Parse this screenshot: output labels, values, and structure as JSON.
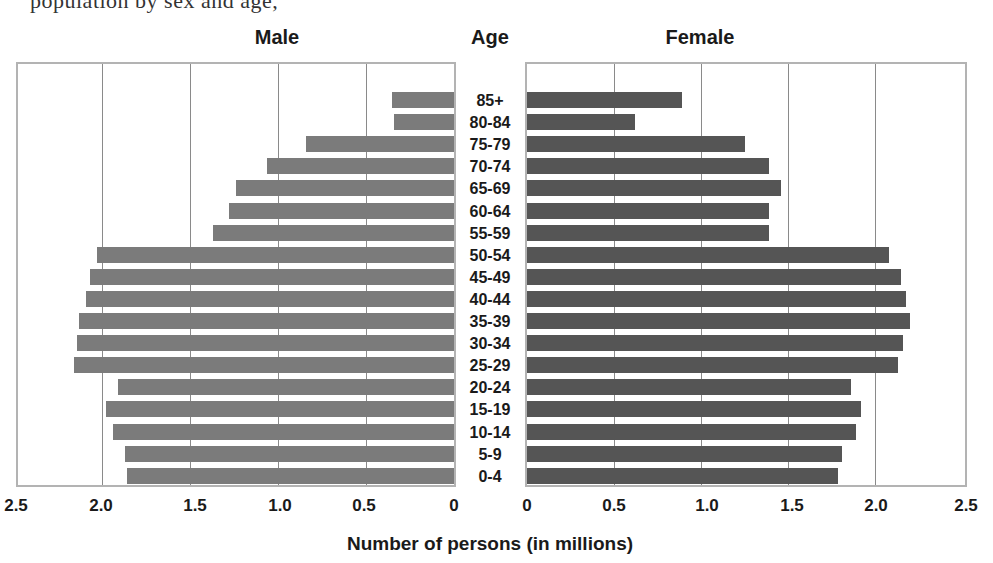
{
  "page": {
    "cutoff_text": "population by sex and age,"
  },
  "chart_data": {
    "type": "bar",
    "subtype": "population-pyramid",
    "title": "",
    "headers": {
      "left": "Male",
      "center": "Age",
      "right": "Female"
    },
    "xlabel": "Number of persons (in millions)",
    "ylabel": "Age",
    "xlim": [
      0,
      2.5
    ],
    "x_ticks_left": [
      "2.5",
      "2.0",
      "1.5",
      "1.0",
      "0.5",
      "0"
    ],
    "x_ticks_right": [
      "0",
      "0.5",
      "1.0",
      "1.5",
      "2.0",
      "2.5"
    ],
    "grid": true,
    "categories": [
      "85+",
      "80-84",
      "75-79",
      "70-74",
      "65-69",
      "60-64",
      "55-59",
      "50-54",
      "45-49",
      "40-44",
      "35-39",
      "30-34",
      "25-29",
      "20-24",
      "15-19",
      "10-14",
      "5-9",
      "0-4"
    ],
    "series": [
      {
        "name": "Male",
        "color": "#7b7b7b",
        "values": [
          0.35,
          0.34,
          0.84,
          1.06,
          1.24,
          1.28,
          1.37,
          2.03,
          2.07,
          2.09,
          2.13,
          2.14,
          2.16,
          1.91,
          1.98,
          1.94,
          1.87,
          1.86
        ]
      },
      {
        "name": "Female",
        "color": "#555555",
        "values": [
          0.89,
          0.62,
          1.25,
          1.39,
          1.46,
          1.39,
          1.39,
          2.08,
          2.15,
          2.18,
          2.2,
          2.16,
          2.13,
          1.86,
          1.92,
          1.89,
          1.81,
          1.79
        ]
      }
    ]
  }
}
